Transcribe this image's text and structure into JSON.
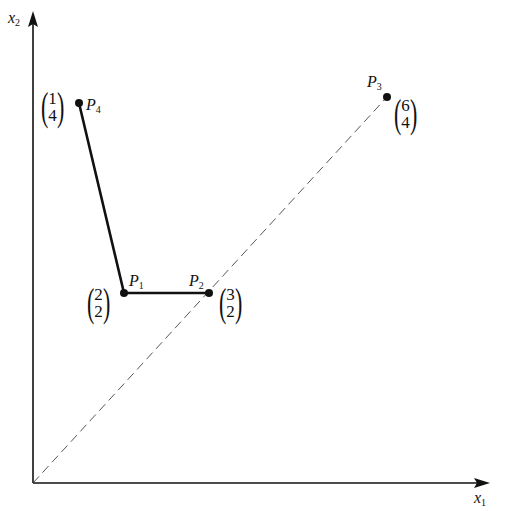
{
  "axes": {
    "x_label": {
      "base": "x",
      "sub": "1"
    },
    "y_label": {
      "base": "x",
      "sub": "2"
    }
  },
  "points": [
    {
      "name": "P1",
      "base": "P",
      "sub": "1",
      "coords": [
        "2",
        "2"
      ]
    },
    {
      "name": "P2",
      "base": "P",
      "sub": "2",
      "coords": [
        "3",
        "2"
      ]
    },
    {
      "name": "P3",
      "base": "P",
      "sub": "3",
      "coords": [
        "6",
        "4"
      ]
    },
    {
      "name": "P4",
      "base": "P",
      "sub": "4",
      "coords": [
        "1",
        "4"
      ]
    }
  ],
  "paths": {
    "solid": "P4 → P1 → P2",
    "dashed": "origin → P3 (through P2)"
  },
  "colors": {
    "ink": "#111111",
    "dashed": "#444444",
    "background": "#ffffff"
  }
}
